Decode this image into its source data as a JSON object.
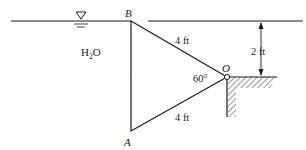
{
  "diagram": {
    "fluid_label": "H",
    "fluid_subscript": "2",
    "fluid_suffix": "O",
    "point_labels": {
      "top": "B",
      "bottom": "A",
      "hinge": "O"
    },
    "dimensions": {
      "upper_side": "4 ft",
      "lower_side": "4 ft",
      "depth": "2 ft",
      "angle": "60°"
    },
    "icons": {
      "free_surface": "free-surface-triangle-icon",
      "hinge": "hinge-circle-icon",
      "ground": "ground-hatch-icon"
    },
    "colors": {
      "line": "#1a1a1a",
      "background": "#ffffff"
    }
  }
}
